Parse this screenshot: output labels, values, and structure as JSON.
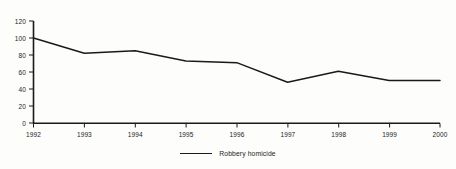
{
  "chart_data": {
    "type": "line",
    "title": "",
    "subtitle": "",
    "xlabel": "",
    "ylabel": "",
    "categories": [
      "1992",
      "1993",
      "1994",
      "1995",
      "1996",
      "1997",
      "1998",
      "1999",
      "2000"
    ],
    "x": [
      1992,
      1993,
      1994,
      1995,
      1996,
      1997,
      1998,
      1999,
      2000
    ],
    "series": [
      {
        "name": "Robbery homicide",
        "values": [
          100,
          82,
          85,
          73,
          71,
          48,
          61,
          50,
          50
        ],
        "color": "#1a1a1a"
      }
    ],
    "ylim": [
      0,
      120
    ],
    "yticks": [
      0,
      20,
      40,
      60,
      80,
      100,
      120
    ],
    "ytick_labels": [
      "0",
      "20",
      "40",
      "60",
      "80",
      "100",
      "120"
    ],
    "xticks": [
      1992,
      1993,
      1994,
      1995,
      1996,
      1997,
      1998,
      1999,
      2000
    ],
    "xtick_labels": [
      "1992",
      "1993",
      "1994",
      "1995",
      "1996",
      "1997",
      "1998",
      "1999",
      "2000"
    ],
    "grid": false,
    "legend_position": "bottom-center",
    "legend_entries": [
      "Robbery homicide"
    ]
  },
  "legend": {
    "series_label": "Robbery homicide"
  },
  "axes": {
    "y_labels": [
      "120",
      "100",
      "80",
      "60",
      "40",
      "20",
      "0"
    ],
    "x_labels": [
      "1992",
      "1993",
      "1994",
      "1995",
      "1996",
      "1997",
      "1998",
      "1999",
      "2000"
    ]
  },
  "colors": {
    "line": "#1a1a1a",
    "axis": "#1a1a1a",
    "background": "#fdfdfc",
    "text": "#1c1c1c"
  }
}
